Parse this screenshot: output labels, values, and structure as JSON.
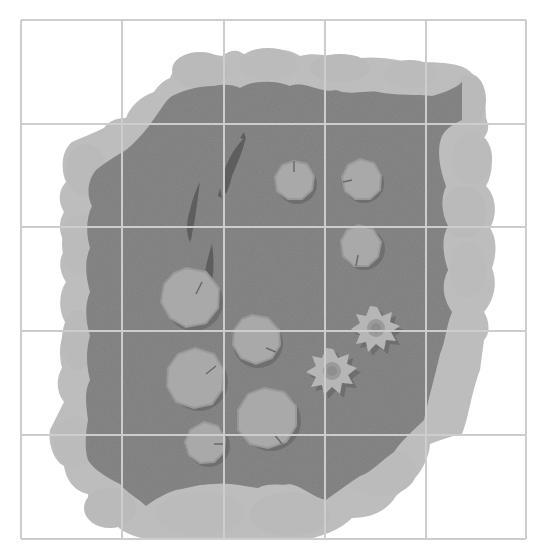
{
  "map": {
    "title": "Pond battle map",
    "kind": "top-down tabletop grid map",
    "grid": {
      "columns": 5,
      "rows": 5,
      "x_lines": [
        21,
        122,
        224,
        325,
        426,
        526
      ],
      "y_lines": [
        20,
        124,
        227,
        331,
        435,
        539
      ],
      "line_color": "#cfcfcf",
      "line_color_over_water": "#c4c4c4"
    },
    "colors": {
      "background": "#ffffff",
      "water": "#7b7b7b",
      "rock": "#bdbdbd",
      "rock_edge": "#b3b3b3",
      "lily_pad": "#a9a9a9",
      "lily_pad_rim": "#999999",
      "lily_shadow": "#5f5f5f",
      "lotus": "#b6b6b6",
      "lotus_center": "#8e8e8e",
      "fish": "#5e5e5e"
    },
    "features": {
      "fish": [
        {
          "name": "fish-1",
          "cx": 238,
          "cy": 140,
          "angle": 20,
          "len": 60
        },
        {
          "name": "fish-2",
          "cx": 195,
          "cy": 208,
          "angle": 18,
          "len": 60
        },
        {
          "name": "fish-3",
          "cx": 212,
          "cy": 265,
          "angle": 10,
          "len": 50
        }
      ],
      "lily_pads": [
        {
          "name": "lily-pad-1",
          "cx": 294,
          "cy": 180,
          "r": 20
        },
        {
          "name": "lily-pad-2",
          "cx": 361,
          "cy": 179,
          "r": 20
        },
        {
          "name": "lily-pad-3",
          "cx": 360,
          "cy": 245,
          "r": 21
        },
        {
          "name": "lily-pad-4",
          "cx": 190,
          "cy": 297,
          "r": 29
        },
        {
          "name": "lily-pad-5",
          "cx": 254,
          "cy": 339,
          "r": 25
        },
        {
          "name": "lily-pad-6",
          "cx": 195,
          "cy": 377,
          "r": 29
        },
        {
          "name": "lily-pad-7",
          "cx": 267,
          "cy": 416,
          "r": 30
        },
        {
          "name": "lily-pad-8",
          "cx": 205,
          "cy": 442,
          "r": 21
        }
      ],
      "lotus_flowers": [
        {
          "name": "lotus-flower-1",
          "cx": 377,
          "cy": 331,
          "r": 24
        },
        {
          "name": "lotus-flower-2",
          "cx": 333,
          "cy": 373,
          "r": 25
        }
      ]
    }
  }
}
